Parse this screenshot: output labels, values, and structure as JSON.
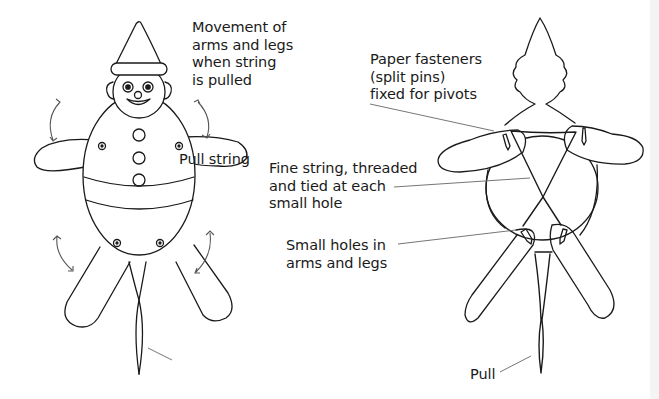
{
  "figure": {
    "left_view": {
      "name": "front view",
      "labels": {
        "movement": "Movement of\narms and legs\nwhen string\nis pulled",
        "pull_string": "Pull string"
      }
    },
    "right_view": {
      "name": "back view",
      "labels": {
        "fasteners": "Paper fasteners\n(split pins)\nfixed for pivots",
        "fine_string": "Fine string, threaded\nand tied at each\nsmall hole",
        "small_holes": "Small holes in\narms and legs",
        "pull": "Pull"
      }
    }
  },
  "colors": {
    "line": "#1a1a1a",
    "arrow": "#555555",
    "leader": "#666666",
    "background": "#ffffff"
  }
}
